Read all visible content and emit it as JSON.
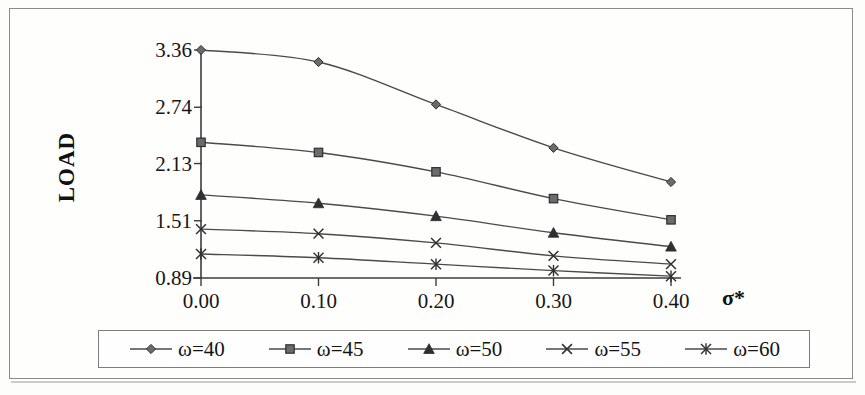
{
  "chart_data": {
    "type": "line",
    "title": "",
    "xlabel": "σ*",
    "ylabel": "LOAD",
    "x": [
      0.0,
      0.1,
      0.2,
      0.3,
      0.4
    ],
    "xtick_labels": [
      "0.00",
      "0.10",
      "0.20",
      "0.30",
      "0.40"
    ],
    "ytick_labels": [
      "0.89",
      "1.51",
      "2.13",
      "2.74",
      "3.36"
    ],
    "ytick_values": [
      0.89,
      1.51,
      2.13,
      2.74,
      3.36
    ],
    "ylim": [
      0.89,
      3.36
    ],
    "xlim": [
      0.0,
      0.4
    ],
    "grid": false,
    "legend_position": "bottom",
    "line_color": "#4a4a4a",
    "marker_color": "#6b6b6b",
    "series": [
      {
        "name": "ω=40",
        "marker": "diamond",
        "values": [
          3.36,
          3.23,
          2.77,
          2.3,
          1.93
        ]
      },
      {
        "name": "ω=45",
        "marker": "square",
        "values": [
          2.36,
          2.25,
          2.04,
          1.75,
          1.52
        ]
      },
      {
        "name": "ω=50",
        "marker": "triangle",
        "values": [
          1.79,
          1.7,
          1.56,
          1.38,
          1.23
        ]
      },
      {
        "name": "ω=55",
        "marker": "cross",
        "values": [
          1.42,
          1.37,
          1.27,
          1.13,
          1.04
        ]
      },
      {
        "name": "ω=60",
        "marker": "asterisk",
        "values": [
          1.15,
          1.11,
          1.04,
          0.97,
          0.91
        ]
      }
    ]
  },
  "axes": {
    "y_title": "LOAD",
    "x_title": "σ*"
  },
  "legend": {
    "items": [
      {
        "label": "ω=40",
        "marker": "diamond-marker"
      },
      {
        "label": "ω=45",
        "marker": "square-marker"
      },
      {
        "label": "ω=50",
        "marker": "triangle-marker"
      },
      {
        "label": "ω=55",
        "marker": "cross-marker"
      },
      {
        "label": "ω=60",
        "marker": "asterisk-marker"
      }
    ]
  }
}
